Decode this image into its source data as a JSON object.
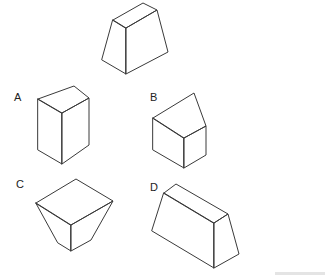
{
  "question": {
    "reference_shape": {
      "name": "reference-frustum",
      "faces": [
        "113,20 143,3 157,10 126,28",
        "113,20 126,28 126,74 102,60",
        "126,28 157,10 168,52 126,74"
      ]
    },
    "options": [
      {
        "label": "A",
        "label_pos": [
          14,
          101
        ],
        "faces": [
          "38,99 74,86 89,98 62,113",
          "38,99 62,113 62,164 38,150",
          "62,113 89,98 89,145 62,164"
        ]
      },
      {
        "label": "B",
        "label_pos": [
          150,
          101
        ],
        "faces": [
          "153,118 194,93 206,126 184,138",
          "153,118 184,138 184,168 153,150",
          "184,138 206,126 206,155 184,168"
        ]
      },
      {
        "label": "C",
        "label_pos": [
          16,
          188
        ],
        "faces": [
          "36,203 76,179 113,201 71,225",
          "36,203 71,225 71,251 58,243",
          "71,225 113,201 91,240 71,251"
        ]
      },
      {
        "label": "D",
        "label_pos": [
          150,
          191
        ],
        "faces": [
          "164,193 176,184 228,214 214,223",
          "164,193 214,223 214,268 152,231",
          "214,223 228,214 239,254 214,268"
        ]
      }
    ]
  }
}
